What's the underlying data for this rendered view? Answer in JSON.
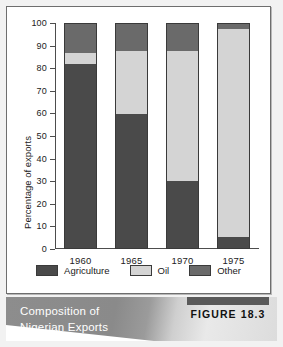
{
  "chart_data": {
    "type": "bar",
    "stacked": true,
    "title": "Composition of Nigerian Exports",
    "xlabel": "",
    "ylabel": "Percentage of exports",
    "ylim": [
      0,
      100
    ],
    "ytick_labels": [
      "0",
      "10",
      "20",
      "30",
      "40",
      "50",
      "60",
      "70",
      "80",
      "90",
      "100"
    ],
    "yticks": [
      0,
      10,
      20,
      30,
      40,
      50,
      60,
      70,
      80,
      90,
      100
    ],
    "categories": [
      "1960",
      "1965",
      "1970",
      "1975"
    ],
    "grid": false,
    "legend_position": "bottom",
    "series": [
      {
        "name": "Agriculture",
        "color": "#4a4a4a",
        "values": [
          82,
          60,
          30,
          5
        ]
      },
      {
        "name": "Oil",
        "color": "#d4d4d4",
        "values": [
          5,
          28,
          58,
          93
        ]
      },
      {
        "name": "Other",
        "color": "#6a6a6a",
        "values": [
          13,
          12,
          12,
          2
        ]
      }
    ]
  },
  "caption": {
    "line1": "Composition of",
    "line2": "Nigerian Exports",
    "figure_label": "FIGURE 18.3"
  }
}
